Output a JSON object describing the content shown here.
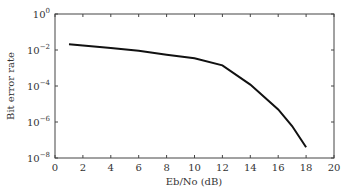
{
  "chart_data": {
    "type": "line",
    "title": "",
    "xlabel": "Eb/No (dB)",
    "ylabel": "Bit error rate",
    "xlim": [
      0,
      20
    ],
    "ylim": [
      1e-08,
      1
    ],
    "yscale": "log",
    "grid": false,
    "x_ticks": [
      "0",
      "2",
      "4",
      "6",
      "8",
      "10",
      "12",
      "14",
      "16",
      "18",
      "20"
    ],
    "y_ticks": [
      "10^0",
      "10^-2",
      "10^-4",
      "10^-6",
      "10^-8"
    ],
    "series": [
      {
        "name": "BER",
        "color": "#111111",
        "x": [
          1,
          2,
          4,
          6,
          8,
          10,
          12,
          14,
          16,
          17,
          18
        ],
        "y": [
          0.021,
          0.018,
          0.013,
          0.009,
          0.0055,
          0.0035,
          0.0014,
          0.00012,
          5e-06,
          6e-07,
          4e-08
        ]
      }
    ]
  }
}
